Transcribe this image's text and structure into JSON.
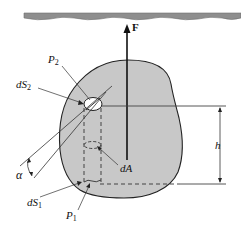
{
  "diagram": {
    "labels": {
      "force": "F",
      "p2": "P",
      "p2_sub": "2",
      "ds2": "dS",
      "ds2_sub": "2",
      "alpha": "α",
      "ds1": "dS",
      "ds1_sub": "1",
      "p1": "P",
      "p1_sub": "1",
      "da": "dA",
      "h": "h"
    },
    "colors": {
      "body_fill": "#c8c8c8",
      "water_surface": "#8a8a8a",
      "line": "#111111",
      "background": "#ffffff"
    }
  }
}
